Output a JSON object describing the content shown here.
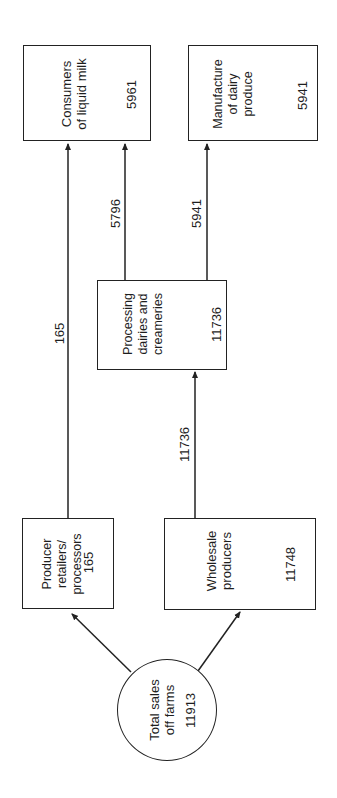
{
  "diagram": {
    "type": "flow",
    "orientation": "rotated-90-ccw",
    "nodes": {
      "total_sales": {
        "label_line1": "Total sales",
        "label_line2": "off farms",
        "value": "11913"
      },
      "producer_retailers": {
        "label_line1": "Producer",
        "label_line2": "retailers/",
        "label_line3": "processors",
        "value": "165"
      },
      "wholesale_producers": {
        "label_line1": "Wholesale",
        "label_line2": "producers",
        "value": "11748"
      },
      "processing_dairies": {
        "label_line1": "Processing",
        "label_line2": "dairies and",
        "label_line3": "creameries",
        "value": "11736"
      },
      "consumers_liquid_milk": {
        "label_line1": "Consumers",
        "label_line2": "of liquid milk",
        "value": "5961"
      },
      "manufacture_dairy": {
        "label_line1": "Manufacture",
        "label_line2": "of dairy",
        "label_line3": "produce",
        "value": "5941"
      }
    },
    "edges": [
      {
        "from": "total_sales",
        "to": "producer_retailers",
        "label": ""
      },
      {
        "from": "total_sales",
        "to": "wholesale_producers",
        "label": ""
      },
      {
        "from": "producer_retailers",
        "to": "consumers_liquid_milk",
        "label": "165"
      },
      {
        "from": "wholesale_producers",
        "to": "processing_dairies",
        "label": "11736"
      },
      {
        "from": "processing_dairies",
        "to": "consumers_liquid_milk",
        "label": "5796"
      },
      {
        "from": "processing_dairies",
        "to": "manufacture_dairy",
        "label": "5941"
      }
    ]
  }
}
